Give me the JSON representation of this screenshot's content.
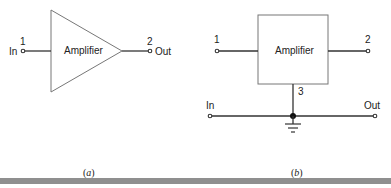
{
  "diagram_a": {
    "block_label": "Amplifier",
    "shape": "triangle",
    "input": {
      "terminal": "1",
      "label": "In"
    },
    "output": {
      "terminal": "2",
      "label": "Out"
    },
    "caption_open": "(",
    "caption_letter": "a",
    "caption_close": ")"
  },
  "diagram_b": {
    "block_label": "Amplifier",
    "shape": "box",
    "terminal_left": "1",
    "terminal_right": "2",
    "terminal_bottom": "3",
    "bottom_left_label": "In",
    "bottom_right_label": "Out",
    "ground": "ground-symbol",
    "caption_open": "(",
    "caption_letter": "b",
    "caption_close": ")"
  },
  "colors": {
    "line": "#333333",
    "box_stroke": "#777777",
    "bar": "#8f8f8f"
  }
}
